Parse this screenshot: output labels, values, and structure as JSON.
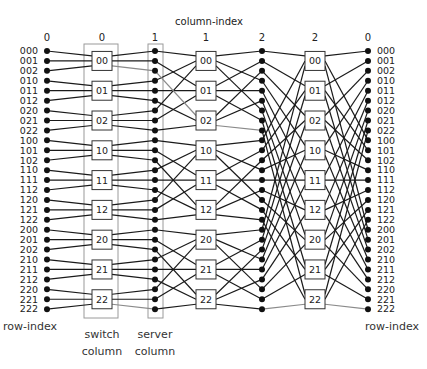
{
  "title": "column-index",
  "column_indices": [
    "0",
    "0",
    "1",
    "1",
    "2",
    "2",
    "0"
  ],
  "row_labels": [
    "000",
    "001",
    "002",
    "010",
    "011",
    "012",
    "020",
    "021",
    "022",
    "100",
    "101",
    "102",
    "110",
    "111",
    "112",
    "120",
    "121",
    "122",
    "200",
    "201",
    "202",
    "210",
    "211",
    "212",
    "220",
    "221",
    "222"
  ],
  "switch_labels": [
    "00",
    "01",
    "02",
    "10",
    "11",
    "12",
    "20",
    "21",
    "22"
  ],
  "row_index_label": "row-index",
  "switch_column_label": [
    "switch",
    "column"
  ],
  "server_column_label": [
    "server",
    "column"
  ],
  "colors": {
    "wire": "#1a1a1a",
    "highlight_wire": "#8a8a8a",
    "node": "#111111",
    "box_border": "#333333",
    "group_box_border": "#9a9a9a",
    "text": "#222222"
  },
  "layout": {
    "row_y0": 51,
    "row_dy": 9.93,
    "dot_columns_x": [
      47,
      155,
      262,
      368
    ],
    "switch_columns_x": [
      102,
      206,
      315
    ],
    "column_label_x": [
      47,
      102,
      155,
      206,
      262,
      315,
      368
    ],
    "column_label_y": 41,
    "title_x": 209,
    "title_y": 25
  }
}
